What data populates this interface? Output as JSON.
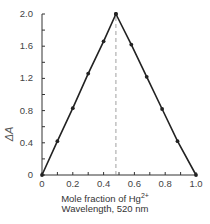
{
  "chart_data": {
    "type": "line",
    "title": "",
    "xlabel": "Mole fraction of Hg2+",
    "xlabel_line2": "Wavelength, 520 nm",
    "ylabel": "ΔA",
    "xlim": [
      0,
      1.0
    ],
    "ylim": [
      0,
      2.0
    ],
    "x_ticks": [
      "0",
      "0.2",
      "0.4",
      "0.6",
      "0.8",
      "1.0"
    ],
    "y_ticks": [
      "0",
      "0.4",
      "0.8",
      "1.2",
      "1.6",
      "2.0"
    ],
    "grid": false,
    "legend": null,
    "series": [
      {
        "name": "Ascending",
        "x": [
          0,
          0.1,
          0.2,
          0.3,
          0.4,
          0.48
        ],
        "y": [
          0,
          0.42,
          0.83,
          1.26,
          1.66,
          2.0
        ]
      },
      {
        "name": "Descending",
        "x": [
          0.48,
          0.58,
          0.68,
          0.78,
          0.88,
          1.0
        ],
        "y": [
          2.0,
          1.62,
          1.22,
          0.82,
          0.42,
          0
        ]
      }
    ],
    "annotations": [
      {
        "type": "vertical-dashed-line",
        "x": 0.48,
        "from_y": 0,
        "to_y": 2.0
      }
    ]
  },
  "labels": {
    "ylabel": "ΔA",
    "xlabel_prefix": "Mole fraction of Hg",
    "xlabel_sup": "2+",
    "xlabel_line2": "Wavelength, 520 nm",
    "y_ticks": [
      "2.0",
      "1.6",
      "1.2",
      "0.8",
      "0.4",
      "0"
    ],
    "x_ticks": [
      "0",
      "0.2",
      "0.4",
      "0.6",
      "0.8",
      "1.0"
    ]
  }
}
